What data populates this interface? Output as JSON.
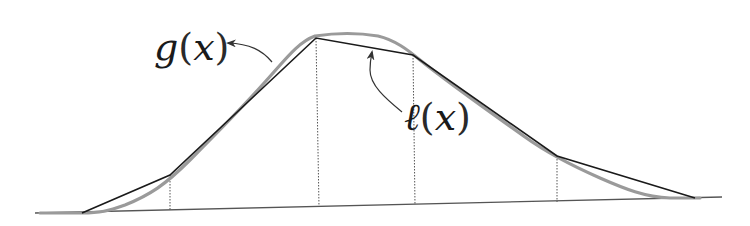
{
  "diagram": {
    "type": "piecewise-linear-approximation",
    "labels": {
      "g": {
        "func": "g",
        "open": "(",
        "var": "x",
        "close": ")"
      },
      "l": {
        "func": "ℓ",
        "open": "(",
        "var": "x",
        "close": ")"
      }
    },
    "colors": {
      "curve_g": "#9a9a9a",
      "polyline_l": "#1a1a1a",
      "baseline": "#555555",
      "dotted": "#555555",
      "arrow": "#333333"
    },
    "baseline": [
      [
        35,
        213
      ],
      [
        722,
        197
      ]
    ],
    "polyline_l": [
      [
        82,
        213
      ],
      [
        170,
        175
      ],
      [
        316,
        38
      ],
      [
        413,
        55
      ],
      [
        557,
        156
      ],
      [
        695,
        198
      ]
    ],
    "knots_x": [
      170,
      316,
      413,
      557
    ],
    "curve_g": [
      [
        40,
        213
      ],
      [
        82,
        213
      ],
      [
        105,
        212
      ],
      [
        130,
        203
      ],
      [
        160,
        185
      ],
      [
        200,
        150
      ],
      [
        240,
        110
      ],
      [
        270,
        78
      ],
      [
        295,
        50
      ],
      [
        312,
        36
      ],
      [
        340,
        34
      ],
      [
        375,
        36
      ],
      [
        400,
        45
      ],
      [
        418,
        58
      ],
      [
        450,
        82
      ],
      [
        490,
        112
      ],
      [
        530,
        140
      ],
      [
        565,
        160
      ],
      [
        600,
        178
      ],
      [
        635,
        192
      ],
      [
        665,
        198
      ],
      [
        700,
        198
      ]
    ]
  }
}
